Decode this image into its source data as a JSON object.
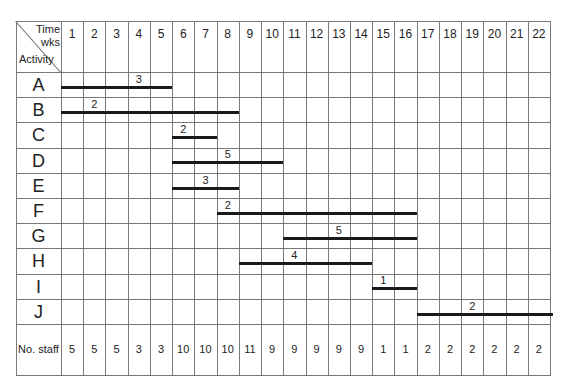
{
  "chart_data": {
    "type": "table",
    "subtype": "gantt",
    "header": {
      "corner_top": "Time",
      "corner_top2": "wks",
      "corner_bottom": "Activity"
    },
    "weeks": [
      "1",
      "2",
      "3",
      "4",
      "5",
      "6",
      "7",
      "8",
      "9",
      "10",
      "11",
      "12",
      "13",
      "14",
      "15",
      "16",
      "17",
      "18",
      "19",
      "20",
      "21",
      "22"
    ],
    "activities": [
      {
        "name": "A",
        "start_week": 1,
        "end_week": 5,
        "staff": "3"
      },
      {
        "name": "B",
        "start_week": 1,
        "end_week": 8,
        "staff": "2"
      },
      {
        "name": "C",
        "start_week": 6,
        "end_week": 7,
        "staff": "2"
      },
      {
        "name": "D",
        "start_week": 6,
        "end_week": 10,
        "staff": "5"
      },
      {
        "name": "E",
        "start_week": 6,
        "end_week": 8,
        "staff": "3"
      },
      {
        "name": "F",
        "start_week": 8,
        "end_week": 16,
        "staff": "2"
      },
      {
        "name": "G",
        "start_week": 11,
        "end_week": 16,
        "staff": "5"
      },
      {
        "name": "H",
        "start_week": 9,
        "end_week": 14,
        "staff": "4"
      },
      {
        "name": "I",
        "start_week": 15,
        "end_week": 16,
        "staff": "1"
      },
      {
        "name": "J",
        "start_week": 17,
        "end_week": 22,
        "staff": "2"
      }
    ],
    "staff_row_label": "No. staff",
    "staff_per_week": [
      "5",
      "5",
      "5",
      "3",
      "3",
      "10",
      "10",
      "10",
      "11",
      "9",
      "9",
      "9",
      "9",
      "9",
      "1",
      "1",
      "2",
      "2",
      "2",
      "2",
      "2",
      "2"
    ],
    "bar_label_offsets": [
      3,
      1,
      0,
      2,
      1,
      0,
      2,
      2,
      0,
      2
    ]
  }
}
